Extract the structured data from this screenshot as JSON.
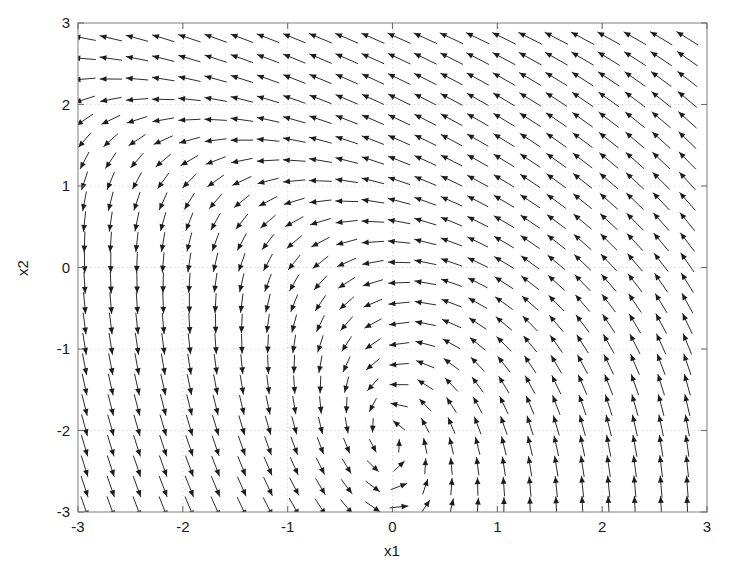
{
  "figure": {
    "background_color": "#ffffff",
    "width": 740,
    "height": 578
  },
  "chart_data": {
    "type": "quiver",
    "title": "",
    "subtitle": "",
    "xlabel": "x1",
    "ylabel": "x2",
    "xlim": [
      -3,
      3
    ],
    "ylim": [
      -3,
      3
    ],
    "xticks": [
      -3,
      -2,
      -1,
      0,
      1,
      2,
      3
    ],
    "yticks": [
      -3,
      -2,
      -1,
      0,
      1,
      2,
      3
    ],
    "xticklabels": [
      "-3",
      "-2",
      "-1",
      "0",
      "1",
      "2",
      "3"
    ],
    "yticklabels": [
      "-3",
      "-2",
      "-1",
      "0",
      "1",
      "2",
      "3"
    ],
    "grid": true,
    "grid_style": "dotted",
    "grid_color": "#cfcfcf",
    "legend": null,
    "legend_position": "none",
    "arrow_color": "#1c1c1c",
    "axis_color": "#8a8a8a",
    "sample_spacing": 0.25,
    "sample_start": -2.9375,
    "sample_count": 24,
    "arrow_scale": 0.145,
    "arrow_max_length_units": 0.26,
    "field_description": "Planar autonomous vector field with a clockwise spiral/vortex near (-0.75, -1.5), an unstable focus near (1.0, 1.0), and leftward-converging flow along the mid-right band. Arrows normalized to near-uniform length as in MATLAB quiver with equal scaling.",
    "field_definition": {
      "u_expression": "-sin(0.5*(x1+0.7)) - 0.55*(x2+1.5)",
      "v_expression": "0.95*(x1+0.7) - 0.45*sin(1.25*(x2+1.5)) - 0.30*(x2-1.0)*(x1-1.0)"
    },
    "features": [
      {
        "name": "vortex-center",
        "x": -0.75,
        "y": -1.5,
        "kind": "spiral"
      },
      {
        "name": "unstable-node",
        "x": 1.0,
        "y": 1.0,
        "kind": "source"
      },
      {
        "name": "saddle-region",
        "x": -1.0,
        "y": -2.0,
        "kind": "saddle"
      }
    ],
    "axis_pixel_box": {
      "left": 78,
      "top": 23,
      "right": 707,
      "bottom": 512
    }
  }
}
